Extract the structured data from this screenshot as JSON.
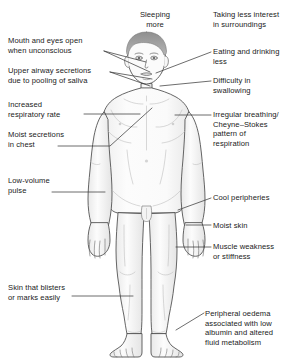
{
  "diagram": {
    "colors": {
      "background": "#ffffff",
      "text": "#1a1a1a",
      "outline": "#4a4a4a",
      "leader_line": "#3c3c3c",
      "skin_fill": "#fbfbfb",
      "hair_fill": "#9a9a9a",
      "shading": "#e8e8e8"
    },
    "labels": [
      {
        "id": "sleeping-more",
        "text": "Sleeping\nmore",
        "align": "center",
        "x": 120,
        "y": 10,
        "w": 70,
        "has_leader": false
      },
      {
        "id": "taking-less-interest",
        "text": "Taking less interest\nin surroundings",
        "align": "left",
        "x": 213,
        "y": 10,
        "w": 80,
        "has_leader": false
      },
      {
        "id": "mouth-and-eyes-open",
        "text": "Mouth and eyes open\nwhen unconscious",
        "align": "left",
        "x": 8,
        "y": 36,
        "w": 100,
        "has_leader": true
      },
      {
        "id": "eating-and-drinking-less",
        "text": "Eating and drinking\nless",
        "align": "left",
        "x": 213,
        "y": 47,
        "w": 80,
        "has_leader": true
      },
      {
        "id": "upper-airway-secretions",
        "text": "Upper airway secretions\ndue to pooling of saliva",
        "align": "left",
        "x": 8,
        "y": 66,
        "w": 105,
        "has_leader": true
      },
      {
        "id": "difficulty-in-swallowing",
        "text": "Difficulty in\nswallowing",
        "align": "left",
        "x": 213,
        "y": 76,
        "w": 80,
        "has_leader": true
      },
      {
        "id": "increased-respiratory-rate",
        "text": "Increased\nrespiratory rate",
        "align": "left",
        "x": 8,
        "y": 100,
        "w": 80,
        "has_leader": true
      },
      {
        "id": "irregular-breathing",
        "text": "Irregular breathing/\nCheyne–Stokes\npattern of\nrespiration",
        "align": "left",
        "x": 213,
        "y": 110,
        "w": 80,
        "has_leader": true
      },
      {
        "id": "moist-secretions-in-chest",
        "text": "Moist secretions\nin chest",
        "align": "left",
        "x": 8,
        "y": 130,
        "w": 80,
        "has_leader": true
      },
      {
        "id": "low-volume-pulse",
        "text": "Low-volume\npulse",
        "align": "left",
        "x": 8,
        "y": 176,
        "w": 80,
        "has_leader": true
      },
      {
        "id": "cool-peripheries",
        "text": "Cool peripheries",
        "align": "left",
        "x": 213,
        "y": 193,
        "w": 80,
        "has_leader": true
      },
      {
        "id": "moist-skin",
        "text": "Moist skin",
        "align": "left",
        "x": 213,
        "y": 221,
        "w": 80,
        "has_leader": true
      },
      {
        "id": "muscle-weakness",
        "text": "Muscle weakness\nor stiffness",
        "align": "left",
        "x": 213,
        "y": 242,
        "w": 80,
        "has_leader": true
      },
      {
        "id": "skin-that-blisters",
        "text": "Skin that blisters\nor marks easily",
        "align": "left",
        "x": 8,
        "y": 283,
        "w": 85,
        "has_leader": true
      },
      {
        "id": "peripheral-oedema",
        "text": "Peripheral oedema\nassociated with low\nalbumin and altered\nfluid metabolism",
        "align": "left",
        "x": 205,
        "y": 309,
        "w": 88,
        "has_leader": true
      }
    ],
    "leader_lines": [
      {
        "id": "leader-mouth-and-eyes-open",
        "points": "104,51 150,72"
      },
      {
        "id": "leader-mouth-and-eyes-open-2",
        "points": "104,51 146,62"
      },
      {
        "id": "leader-eating-and-drinking-less",
        "points": "211,52 156,73"
      },
      {
        "id": "leader-upper-airway-secretions",
        "points": "110,72 152,79"
      },
      {
        "id": "leader-upper-airway-secretions-2",
        "points": "110,72 150,86"
      },
      {
        "id": "leader-difficulty-in-swallowing",
        "points": "211,81 160,86"
      },
      {
        "id": "leader-increased-respiratory-rate",
        "points": "84,114 140,114"
      },
      {
        "id": "leader-irregular-breathing",
        "points": "211,115 175,115"
      },
      {
        "id": "leader-moist-secretions-in-chest",
        "points": "58,146 110,146 152,108"
      },
      {
        "id": "leader-low-volume-pulse",
        "points": "52,192 105,192"
      },
      {
        "id": "leader-cool-peripheries",
        "points": "211,198 178,210"
      },
      {
        "id": "leader-moist-skin",
        "points": "211,225 186,225"
      },
      {
        "id": "leader-muscle-weakness",
        "points": "211,247 176,247"
      },
      {
        "id": "leader-skin-that-blisters",
        "points": "72,296 133,296"
      },
      {
        "id": "leader-peripheral-oedema",
        "points": "204,313 176,330"
      }
    ]
  }
}
